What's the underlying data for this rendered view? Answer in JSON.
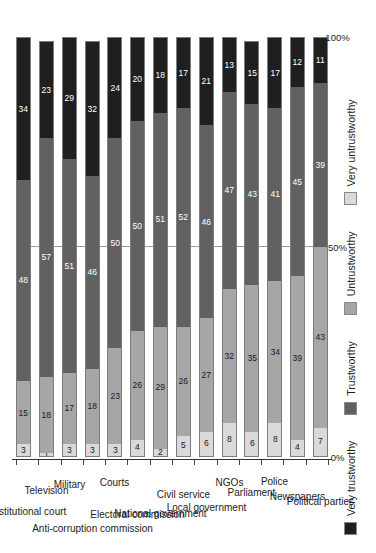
{
  "chart_data": {
    "type": "bar",
    "orientation": "horizontal-stacked",
    "title": "",
    "subtitle": "",
    "xlabel": "",
    "ylabel": "",
    "xlim": [
      0,
      100
    ],
    "xtick_labels": [
      "0%",
      "50%",
      "100%"
    ],
    "xtick_values": [
      0,
      50,
      100
    ],
    "grid": false,
    "legend_position": "top-left",
    "stack_total": 100,
    "legend": [
      {
        "label": "Very untrustworthy",
        "color": "#d9d9d9"
      },
      {
        "label": "Untrustworthy",
        "color": "#a6a6a6"
      },
      {
        "label": "Trustworthy",
        "color": "#616161"
      },
      {
        "label": "Very trustworthy",
        "color": "#1f1f1f"
      }
    ],
    "categories": [
      "Constitutional court",
      "Television",
      "Military",
      "Anti-corruption commission",
      "Courts",
      "Electoral commission",
      "National government",
      "Civil service",
      "Local government",
      "NGOs",
      "Parliament",
      "Police",
      "Newspapers",
      "Political parties"
    ],
    "series": [
      {
        "name": "Very untrustworthy",
        "color": "#d9d9d9",
        "values": [
          3,
          1,
          3,
          3,
          3,
          4,
          2,
          5,
          6,
          8,
          6,
          8,
          4,
          7
        ]
      },
      {
        "name": "Untrustworthy",
        "color": "#a6a6a6",
        "values": [
          15,
          18,
          17,
          18,
          23,
          26,
          29,
          26,
          27,
          32,
          35,
          34,
          39,
          43
        ]
      },
      {
        "name": "Trustworthy",
        "color": "#616161",
        "values": [
          48,
          57,
          51,
          46,
          50,
          50,
          51,
          52,
          46,
          47,
          43,
          41,
          45,
          39
        ]
      },
      {
        "name": "Very trustworthy",
        "color": "#1f1f1f",
        "values": [
          34,
          23,
          29,
          32,
          24,
          20,
          18,
          17,
          21,
          13,
          15,
          17,
          12,
          11
        ]
      }
    ]
  }
}
